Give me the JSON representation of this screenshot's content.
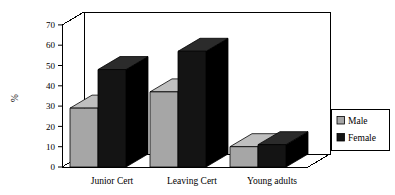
{
  "chart_data": {
    "type": "bar",
    "title": "",
    "subtitle": "",
    "xlabel": "",
    "ylabel": "%",
    "ylim": [
      0,
      70
    ],
    "yticks": [
      0,
      10,
      20,
      30,
      40,
      50,
      60,
      70
    ],
    "ytick_labels": [
      "0",
      "10",
      "20",
      "30",
      "40",
      "50",
      "60",
      "70"
    ],
    "categories": [
      "Junior Cert",
      "Leaving Cert",
      "Young adults"
    ],
    "series": [
      {
        "name": "Male",
        "color": "#A6A6A6",
        "values": [
          29,
          37,
          10
        ]
      },
      {
        "name": "Female",
        "color": "#1A1A1A",
        "values": [
          48,
          57,
          11
        ]
      }
    ],
    "grid": false,
    "legend_position": "right",
    "style": "3d-column",
    "annotations": []
  },
  "legend": {
    "entries": [
      {
        "label": "Male",
        "swatch": "male-swatch"
      },
      {
        "label": "Female",
        "swatch": "female-swatch"
      }
    ]
  },
  "axis": {
    "y_title": "%"
  },
  "colors": {
    "male": "#A6A6A6",
    "male_top": "#BFBFBF",
    "male_side": "#8C8C8C",
    "female": "#141414",
    "female_top": "#2B2B2B",
    "female_side": "#000000",
    "frame": "#000000",
    "background": "#FFFFFF"
  }
}
